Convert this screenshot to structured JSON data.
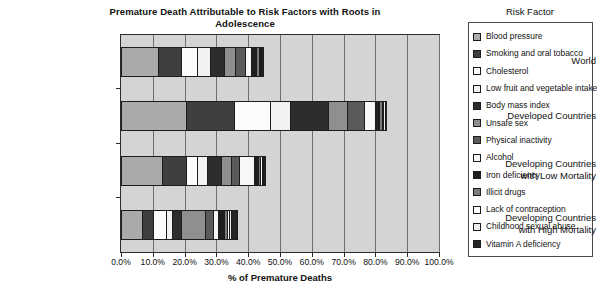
{
  "chart_data": {
    "type": "bar",
    "orientation": "horizontal",
    "stacked": true,
    "title": "Premature Death Attributable to Risk Factors with Roots in Adolescence",
    "xlabel": "% of Premature Deaths",
    "ylabel": "",
    "xlim": [
      0,
      100
    ],
    "grid": true,
    "legend_position": "right",
    "legend_title": "Risk Factor",
    "xticks": [
      "0.0%",
      "10.0%",
      "20.0%",
      "30.0%",
      "40.0%",
      "50.0%",
      "60.0%",
      "70.0%",
      "80.0%",
      "90.0%",
      "100.0%"
    ],
    "xtick_values": [
      0,
      10,
      20,
      30,
      40,
      50,
      60,
      70,
      80,
      90,
      100
    ],
    "categories": [
      "World",
      "Developed Countries",
      "Developing Countries\nwith Low Mortality",
      "Developing Countries\nwith High Mortality"
    ],
    "category_lines": [
      [
        "World"
      ],
      [
        "Developed Countries"
      ],
      [
        "Developing Countries",
        "with Low Mortality"
      ],
      [
        "Developing Countries",
        "with High Mortality"
      ]
    ],
    "series": [
      {
        "name": "Blood pressure",
        "color": "#aaaaaa",
        "values": [
          11.5,
          20.5,
          13.0,
          6.5
        ]
      },
      {
        "name": "Smoking and oral tobacco",
        "color": "#3f3f3f",
        "values": [
          7.5,
          15.0,
          7.5,
          3.5
        ]
      },
      {
        "name": "Cholesterol",
        "color": "#fcfcfc",
        "values": [
          5.0,
          11.5,
          3.5,
          4.0
        ]
      },
      {
        "name": "Low fruit and vegetable intake",
        "color": "#f2f2f2",
        "values": [
          4.0,
          6.0,
          3.0,
          2.0
        ]
      },
      {
        "name": "Body mass index",
        "color": "#2d2d2d",
        "values": [
          4.5,
          12.0,
          4.5,
          3.0
        ]
      },
      {
        "name": "Unsafe sex",
        "color": "#8f8f8f",
        "values": [
          3.5,
          6.0,
          3.0,
          7.5
        ]
      },
      {
        "name": "Physical inactivity",
        "color": "#5a5a5a",
        "values": [
          3.0,
          5.5,
          2.5,
          2.5
        ]
      },
      {
        "name": "Alcohol",
        "color": "#f7f7f7",
        "values": [
          2.0,
          3.5,
          5.0,
          1.5
        ]
      },
      {
        "name": "Iron deficiency",
        "color": "#1f1f1f",
        "values": [
          1.5,
          1.0,
          1.0,
          2.0
        ]
      },
      {
        "name": "Illicit drugs",
        "color": "#7a7a7a",
        "values": [
          0.8,
          1.0,
          0.8,
          0.8
        ]
      },
      {
        "name": "Lack of contraception",
        "color": "#ffffff",
        "values": [
          0.5,
          0.5,
          0.5,
          0.8
        ]
      },
      {
        "name": "Childhood sexual abuse",
        "color": "#ededed",
        "values": [
          0.4,
          0.4,
          0.4,
          0.5
        ]
      },
      {
        "name": "Vitamin A deficiency",
        "color": "#252525",
        "values": [
          0.3,
          0.1,
          0.3,
          1.5
        ]
      }
    ],
    "totals": [
      44.5,
      83.0,
      45.0,
      36.1
    ]
  }
}
